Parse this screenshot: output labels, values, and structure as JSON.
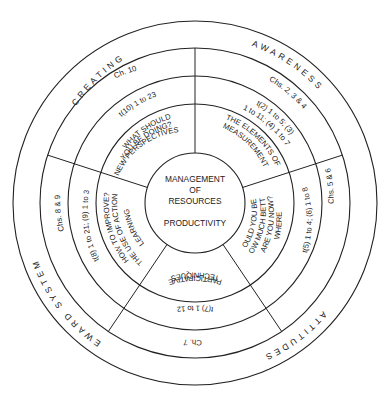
{
  "center": {
    "line1": "MANAGEMENT",
    "line2": "OF",
    "line3": "RESOURCES",
    "line4": "PRODUCTIVITY"
  },
  "outer_ring": [
    {
      "label": "CREATING"
    },
    {
      "label": "AWARENESS"
    },
    {
      "label": "ATTITUDES"
    },
    {
      "label": "REWARD SYSTEMS"
    }
  ],
  "sectors": [
    {
      "name": "top-left",
      "chapters": "Ch. 10",
      "refs": [
        "t(10) 1 to 23"
      ],
      "question": [
        "WHAT SHOULD",
        "YOU BE DOING?",
        "NEW PERSPECTIVES"
      ]
    },
    {
      "name": "top-right",
      "chapters": "Chs. 2, 3 & 4",
      "refs": [
        "t(2) 1 to 5; (3)",
        "1 to 11; (4) 1 to 7"
      ],
      "question": [
        "THE ELEMENTS OF",
        "MEASUREMENT"
      ]
    },
    {
      "name": "right",
      "chapters": "Chs. 5 & 6",
      "refs": [
        "t(5) 1 to 4; (6) 1 to 8"
      ],
      "question": [
        "WHERE",
        "ARE YOU NOW?",
        "HOW MUCH BETTER",
        "COULD YOU BE?"
      ]
    },
    {
      "name": "bottom",
      "chapters": "Ch. 7",
      "refs": [
        "t(7) 1 to 12"
      ],
      "question": [
        "PARTICIPATIVE",
        "TECHNIQUES"
      ]
    },
    {
      "name": "left",
      "chapters": "Chs. 8 & 9",
      "refs": [
        "t(8) 1 to 21; (9) 1 to 3"
      ],
      "question": [
        "HOW TO IMPROVE?",
        "THE USE OF ACTION",
        "LEARNING"
      ]
    }
  ]
}
